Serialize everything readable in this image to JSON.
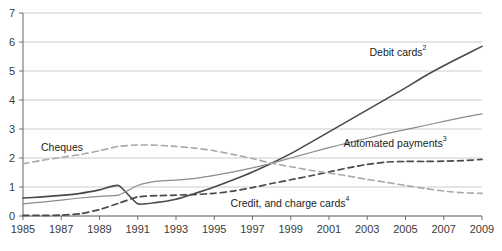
{
  "chart_data": {
    "type": "line",
    "title": "",
    "xlabel": "",
    "ylabel": "",
    "xlim": [
      1985,
      2009
    ],
    "ylim": [
      0,
      7
    ],
    "grid": true,
    "legend_position": "inline-labels",
    "y_ticks": [
      "0",
      "1",
      "2",
      "3",
      "4",
      "5",
      "6",
      "7"
    ],
    "x_ticks": [
      "1985",
      "1987",
      "1989",
      "1991",
      "1993",
      "1995",
      "1997",
      "1999",
      "2001",
      "2003",
      "2005",
      "2007",
      "2009"
    ],
    "x": [
      1985,
      1986,
      1987,
      1988,
      1989,
      1990,
      1991,
      1992,
      1993,
      1994,
      1995,
      1996,
      1997,
      1998,
      1999,
      2000,
      2001,
      2002,
      2003,
      2004,
      2005,
      2006,
      2007,
      2008,
      2009
    ],
    "series": [
      {
        "name": "Debit cards",
        "footnote": "2",
        "label": "Debit cards",
        "style": "solid",
        "color": "#4a4a4a",
        "width": 1.6,
        "label_x": 398,
        "label_y": 56,
        "values": [
          0.62,
          0.66,
          0.71,
          0.78,
          0.9,
          1.05,
          0.42,
          0.47,
          0.58,
          0.78,
          1.0,
          1.25,
          1.52,
          1.82,
          2.15,
          2.52,
          2.9,
          3.28,
          3.66,
          4.04,
          4.42,
          4.82,
          5.18,
          5.52,
          5.85
        ]
      },
      {
        "name": "Automated payments",
        "footnote": "3",
        "label": "Automated payments",
        "style": "solid",
        "color": "#8c8c8c",
        "width": 1.2,
        "label_x": 395,
        "label_y": 147,
        "values": [
          0.42,
          0.48,
          0.55,
          0.62,
          0.68,
          0.72,
          1.05,
          1.2,
          1.24,
          1.3,
          1.4,
          1.52,
          1.66,
          1.82,
          2.0,
          2.18,
          2.36,
          2.52,
          2.68,
          2.84,
          2.98,
          3.12,
          3.26,
          3.4,
          3.52
        ]
      },
      {
        "name": "Credit, and charge cards",
        "footnote": "4",
        "label": "Credit, and charge cards",
        "style": "dashed",
        "color": "#4a4a4a",
        "width": 1.7,
        "label_x": 290,
        "label_y": 207,
        "values": [
          0.02,
          0.02,
          0.03,
          0.08,
          0.22,
          0.44,
          0.66,
          0.7,
          0.72,
          0.74,
          0.78,
          0.86,
          0.98,
          1.12,
          1.25,
          1.38,
          1.52,
          1.66,
          1.78,
          1.86,
          1.88,
          1.88,
          1.89,
          1.91,
          1.95
        ]
      },
      {
        "name": "Cheques",
        "footnote": "",
        "label": "Cheques",
        "style": "dashed",
        "color": "#a8a8a8",
        "width": 1.6,
        "label_x": 62,
        "label_y": 151,
        "values": [
          1.8,
          1.92,
          2.02,
          2.12,
          2.25,
          2.4,
          2.45,
          2.44,
          2.4,
          2.34,
          2.25,
          2.12,
          1.98,
          1.82,
          1.7,
          1.58,
          1.48,
          1.38,
          1.26,
          1.16,
          1.05,
          0.95,
          0.86,
          0.8,
          0.78
        ]
      }
    ]
  },
  "axis": {
    "axis_color": "#808080",
    "grid_color": "#bfbfbf",
    "tick_label_color": "#3a3a3a"
  }
}
